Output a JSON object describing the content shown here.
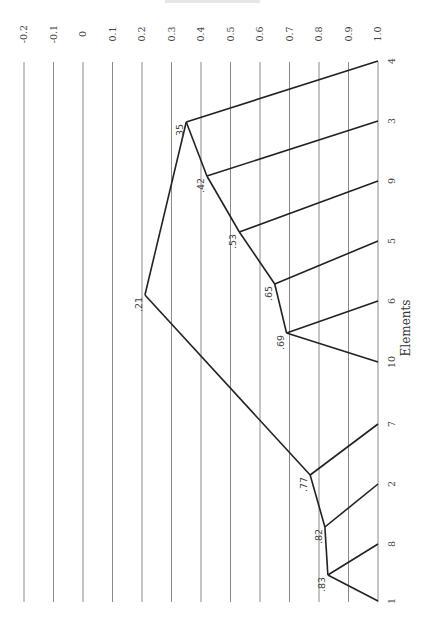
{
  "chart_data": {
    "type": "dendrogram",
    "orientation": "rotated-90",
    "title": "",
    "xlabel": "Elements",
    "ylabel": "",
    "similarity_axis": {
      "ticks": [
        "-0.2",
        "-0.1",
        "0",
        "0.1",
        "0.2",
        "0.3",
        "0.4",
        "0.5",
        "0.6",
        "0.7",
        "0.8",
        "0.9",
        "1.0"
      ],
      "tick_values": [
        -0.2,
        -0.1,
        0,
        0.1,
        0.2,
        0.3,
        0.4,
        0.5,
        0.6,
        0.7,
        0.8,
        0.9,
        1.0
      ],
      "range": [
        -0.2,
        1.0
      ],
      "grid": true
    },
    "leaves": [
      "4",
      "3",
      "9",
      "5",
      "6",
      "10",
      "7",
      "2",
      "8",
      "1"
    ],
    "merges": [
      {
        "id": "n83",
        "label": ".83",
        "value": 0.83,
        "children": [
          "8",
          "1"
        ]
      },
      {
        "id": "n82",
        "label": ".82",
        "value": 0.82,
        "children": [
          "2",
          "n83"
        ]
      },
      {
        "id": "n77",
        "label": ".77",
        "value": 0.77,
        "children": [
          "7",
          "n82"
        ]
      },
      {
        "id": "n69",
        "label": ".69",
        "value": 0.69,
        "children": [
          "6",
          "10"
        ]
      },
      {
        "id": "n65",
        "label": ".65",
        "value": 0.65,
        "children": [
          "5",
          "n69"
        ]
      },
      {
        "id": "n53",
        "label": ".53",
        "value": 0.53,
        "children": [
          "9",
          "n65"
        ]
      },
      {
        "id": "n42",
        "label": ".42",
        "value": 0.42,
        "children": [
          "3",
          "n53"
        ]
      },
      {
        "id": "n35",
        "label": ".35",
        "value": 0.35,
        "children": [
          "4",
          "n42"
        ]
      },
      {
        "id": "n21",
        "label": ".21",
        "value": 0.21,
        "children": [
          "n35",
          "n77"
        ]
      }
    ]
  },
  "layout": {
    "leaf_y": {
      "4": 61,
      "3": 121,
      "9": 181,
      "5": 241,
      "6": 301,
      "10": 362,
      "7": 424,
      "2": 484,
      "8": 544,
      "1": 601
    },
    "node_y": {
      "n83": 575,
      "n82": 527,
      "n77": 475,
      "n69": 333,
      "n65": 284,
      "n53": 232,
      "n42": 176,
      "n35": 122,
      "n21": 295
    },
    "x_zero": 83,
    "x_per_unit": 295,
    "grid_top": 62,
    "grid_bottom": 602,
    "tick_label_y": 34,
    "leaf_label_x": 395
  }
}
